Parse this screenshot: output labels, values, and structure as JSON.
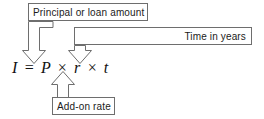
{
  "diagram": {
    "formula": {
      "text": "I = P × r × t",
      "variables": [
        {
          "symbol": "I",
          "meaning": "Interest"
        },
        {
          "symbol": "P",
          "meaning": "Principal or loan amount"
        },
        {
          "symbol": "r",
          "meaning": "Add-on rate"
        },
        {
          "symbol": "t",
          "meaning": "Time in years"
        }
      ]
    },
    "callouts": [
      {
        "id": "principal",
        "label": "Principal or loan amount",
        "points_to": "P",
        "position": "top-left",
        "arrow_direction": "down"
      },
      {
        "id": "time",
        "label": "Time in years",
        "points_to": "t",
        "position": "right",
        "arrow_direction": "down"
      },
      {
        "id": "addon",
        "label": "Add-on rate",
        "points_to": "r",
        "position": "bottom",
        "arrow_direction": "up"
      }
    ],
    "colors": {
      "background": "#ffffff",
      "line": "#6e6e6e",
      "text": "#1b1b1b",
      "formula_text": "#111111"
    }
  }
}
